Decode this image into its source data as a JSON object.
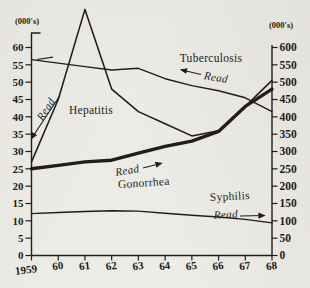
{
  "chart_data": {
    "type": "line",
    "title": "",
    "grid": false,
    "legend": "none",
    "x_axis": {
      "tick_labels": [
        "1959",
        "60",
        "61",
        "62",
        "63",
        "64",
        "65",
        "66",
        "67",
        "68"
      ]
    },
    "left_axis": {
      "unit_label": "(000's)",
      "range": [
        0,
        60
      ],
      "tick_step": 5,
      "tick_labels": [
        "0",
        "5",
        "10",
        "15",
        "20",
        "25",
        "30",
        "35",
        "40",
        "45",
        "50",
        "55",
        "60"
      ]
    },
    "right_axis": {
      "unit_label": "(000's)",
      "range": [
        0,
        600
      ],
      "tick_step": 50,
      "tick_labels": [
        "0",
        "50",
        "100",
        "150",
        "200",
        "250",
        "300",
        "350",
        "400",
        "450",
        "500",
        "550",
        "600"
      ]
    },
    "series": [
      {
        "name": "Tuberculosis",
        "read_axis": "left",
        "line": "thin",
        "values": [
          56.5,
          55.5,
          54.5,
          53.5,
          54,
          51,
          49,
          47.5,
          45.5,
          41.5
        ]
      },
      {
        "name": "Hepatitis",
        "read_axis": "left",
        "line": "thin",
        "values": [
          27,
          45,
          71,
          48,
          41.5,
          38,
          34.5,
          36,
          43,
          50.5
        ]
      },
      {
        "name": "Gonorrhea",
        "read_axis": "right",
        "line": "thick",
        "values": [
          250,
          260,
          270,
          275,
          295,
          315,
          330,
          358,
          430,
          480
        ]
      },
      {
        "name": "Syphilis",
        "read_axis": "right",
        "line": "thin",
        "values": [
          121,
          124,
          127,
          129,
          128,
          122,
          116,
          111,
          104,
          94
        ]
      }
    ],
    "annotations": {
      "read_label": "Read",
      "series_labels": [
        "Tuberculosis",
        "Hepatitis",
        "Gonorrhea",
        "Syphilis"
      ]
    },
    "colors": {
      "ink": "#211d18",
      "paper": "#edebe6"
    }
  }
}
